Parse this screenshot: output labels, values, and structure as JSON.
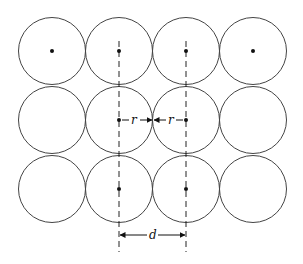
{
  "diagram": {
    "grid": {
      "rows": 3,
      "cols": 4
    },
    "circle_radius_px": 33.5,
    "centers_x": [
      52,
      119,
      186,
      253
    ],
    "centers_y": [
      51,
      120,
      189
    ],
    "dots": [
      {
        "row": 0,
        "col": 0
      },
      {
        "row": 0,
        "col": 1
      },
      {
        "row": 0,
        "col": 2
      },
      {
        "row": 0,
        "col": 3
      },
      {
        "row": 1,
        "col": 1
      },
      {
        "row": 1,
        "col": 2
      },
      {
        "row": 2,
        "col": 1
      },
      {
        "row": 2,
        "col": 2
      }
    ],
    "labels": {
      "radius_left": "r",
      "radius_right": "r",
      "spacing": "d"
    },
    "colors": {
      "stroke": "#444444",
      "dot": "#111111",
      "background": "#ffffff"
    }
  }
}
